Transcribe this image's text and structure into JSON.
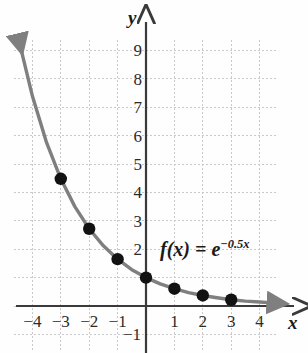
{
  "figure": {
    "background_color": "#fefefe",
    "grid_color": "#c9c9c9",
    "axis_color": "#3a3a3a",
    "curve_color": "#7f7f7f",
    "point_color": "#121212"
  },
  "axes": {
    "x_axis_label": "x",
    "y_axis_label": "y",
    "x_ticks": [
      {
        "label": "−4",
        "value": -4
      },
      {
        "label": "−3",
        "value": -3
      },
      {
        "label": "−2",
        "value": -2
      },
      {
        "label": "−1",
        "value": -1
      },
      {
        "label": "1",
        "value": 1
      },
      {
        "label": "2",
        "value": 2
      },
      {
        "label": "3",
        "value": 3
      },
      {
        "label": "4",
        "value": 4
      }
    ],
    "y_ticks": [
      {
        "label": "9",
        "value": 9
      },
      {
        "label": "8",
        "value": 8
      },
      {
        "label": "7",
        "value": 7
      },
      {
        "label": "6",
        "value": 6
      },
      {
        "label": "5",
        "value": 5
      },
      {
        "label": "4",
        "value": 4
      },
      {
        "label": "3",
        "value": 3
      },
      {
        "label": "2",
        "value": 2
      },
      {
        "label": "−1",
        "value": -1
      }
    ]
  },
  "annotations": {
    "function_label": {
      "f_of_x": "f(x) =",
      "base": "e",
      "exponent": "−0.5x",
      "plain": "f(x) = e^(−0.5x)"
    }
  },
  "chart_data": {
    "type": "line",
    "title": "",
    "xlabel": "x",
    "ylabel": "y",
    "xlim": [
      -4.6,
      4.6
    ],
    "ylim": [
      -1.6,
      10.2
    ],
    "grid": true,
    "grid_step": 1,
    "legend": "none",
    "series": [
      {
        "name": "f(x) = e^(-0.5x)",
        "equation": "e^{-0.5x}",
        "color": "#7f7f7f",
        "arrow_start": true,
        "arrow_end": true,
        "marked_points": [
          {
            "x": -3,
            "y": 4.48
          },
          {
            "x": -2,
            "y": 2.72
          },
          {
            "x": -1,
            "y": 1.65
          },
          {
            "x": 0,
            "y": 1.0
          },
          {
            "x": 1,
            "y": 0.61
          },
          {
            "x": 2,
            "y": 0.37
          },
          {
            "x": 3,
            "y": 0.22
          }
        ],
        "curve_points": [
          {
            "x": -4.45,
            "y": 9.25
          },
          {
            "x": -4.0,
            "y": 7.39
          },
          {
            "x": -3.5,
            "y": 5.75
          },
          {
            "x": -3.0,
            "y": 4.48
          },
          {
            "x": -2.5,
            "y": 3.49
          },
          {
            "x": -2.0,
            "y": 2.72
          },
          {
            "x": -1.5,
            "y": 2.12
          },
          {
            "x": -1.0,
            "y": 1.65
          },
          {
            "x": -0.5,
            "y": 1.28
          },
          {
            "x": 0.0,
            "y": 1.0
          },
          {
            "x": 0.5,
            "y": 0.78
          },
          {
            "x": 1.0,
            "y": 0.61
          },
          {
            "x": 1.5,
            "y": 0.47
          },
          {
            "x": 2.0,
            "y": 0.37
          },
          {
            "x": 2.5,
            "y": 0.29
          },
          {
            "x": 3.0,
            "y": 0.22
          },
          {
            "x": 3.5,
            "y": 0.17
          },
          {
            "x": 4.0,
            "y": 0.14
          },
          {
            "x": 4.6,
            "y": 0.1
          }
        ]
      }
    ]
  },
  "geometry": {
    "origin_px": {
      "x": 146,
      "y": 306
    },
    "unit_px": 28.4,
    "grid_bounds_px": {
      "left": 14,
      "right": 276,
      "top": 40,
      "bottom": 352
    },
    "x_axis_px": {
      "x1": 16,
      "x2": 296,
      "y": 306
    },
    "y_axis_px": {
      "x": 146,
      "y1": 18,
      "y2": 353
    }
  }
}
